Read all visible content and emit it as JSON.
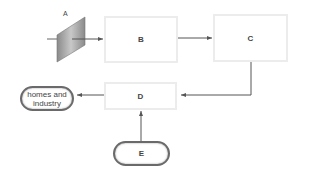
{
  "diagram": {
    "nodes": {
      "A": {
        "label": "A",
        "shape": "tilted-panel"
      },
      "B": {
        "label": "B",
        "shape": "rectangle"
      },
      "C": {
        "label": "C",
        "shape": "rectangle"
      },
      "D": {
        "label": "D",
        "shape": "rectangle"
      },
      "E": {
        "label": "E",
        "shape": "rounded-pill"
      },
      "homes": {
        "label_line1": "homes and",
        "label_line2": "industry",
        "shape": "rounded-pill"
      }
    },
    "edges": [
      {
        "from": "input",
        "to": "B",
        "through": "A"
      },
      {
        "from": "B",
        "to": "C"
      },
      {
        "from": "C",
        "to": "D"
      },
      {
        "from": "E",
        "to": "D"
      },
      {
        "from": "D",
        "to": "homes"
      }
    ],
    "colors": {
      "line": "#666666",
      "box_border": "#ececec",
      "pill_border": "#6a6a6a",
      "panel": "#9a9a9a"
    }
  }
}
